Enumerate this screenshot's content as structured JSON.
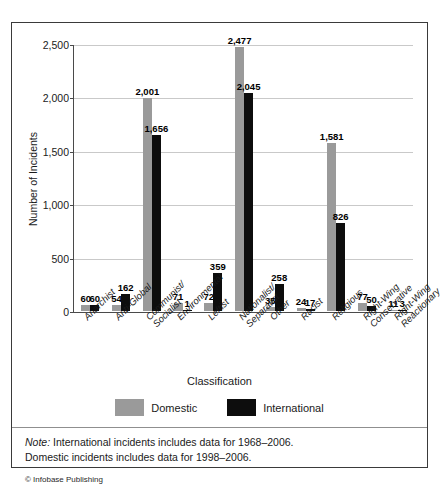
{
  "chart_data": {
    "type": "bar",
    "title": "",
    "xlabel": "Classification",
    "ylabel": "Number of Incidents",
    "ylim": [
      0,
      2500
    ],
    "yticks": [
      "0",
      "500",
      "1,000",
      "1,500",
      "2,000",
      "2,500"
    ],
    "ytick_values": [
      0,
      500,
      1000,
      1500,
      2000,
      2500
    ],
    "grid": true,
    "legend_position": "bottom",
    "categories": [
      "Anarchist",
      "Anti-Global",
      "Communist/\nSocialist",
      "Environmental",
      "Leftist",
      "Nationalist/\nSeparatist",
      "Other",
      "Racist",
      "Religious",
      "Right-Wing\nConservative",
      "Right-Wing\nReactionary"
    ],
    "series": [
      {
        "name": "Domestic",
        "color": "#9a9a9a",
        "values": [
          60,
          54,
          2001,
          71,
          72,
          2477,
          35,
          24,
          1581,
          77,
          11
        ]
      },
      {
        "name": "International",
        "color": "#0d0d0d",
        "values": [
          60,
          162,
          1656,
          1,
          359,
          2045,
          258,
          17,
          826,
          50,
          3
        ]
      }
    ],
    "value_labels": {
      "Domestic": [
        "60",
        "54",
        "2,001",
        "71",
        "72",
        "2,477",
        "35",
        "24",
        "1,581",
        "77",
        "11"
      ],
      "International": [
        "60",
        "162",
        "1,656",
        "1",
        "359",
        "2,045",
        "258",
        "17",
        "826",
        "50",
        "3"
      ]
    },
    "notes": [
      {
        "lead": "Note:",
        "text": " International incidents includes data for 1968–2006."
      },
      {
        "lead": "",
        "text": "Domestic incidents includes data for 1998–2006."
      }
    ],
    "credit": "© Infobase Publishing"
  },
  "legend": {
    "items": [
      {
        "label": "Domestic",
        "color": "#9a9a9a"
      },
      {
        "label": "International",
        "color": "#0d0d0d"
      }
    ]
  }
}
